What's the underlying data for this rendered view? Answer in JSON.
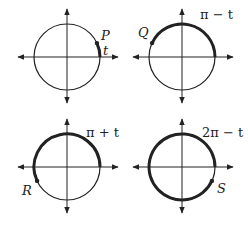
{
  "diagram": {
    "panels": [
      {
        "id": "P",
        "point_label": "P",
        "arc_label": "t",
        "center": [
          67,
          57
        ],
        "radius": 33,
        "point_angle_deg": 25,
        "arc_from_deg": 0,
        "arc_to_deg": 25
      },
      {
        "id": "Q",
        "point_label": "Q",
        "arc_label": "π − t",
        "center": [
          182,
          57
        ],
        "radius": 33,
        "point_angle_deg": 155,
        "arc_from_deg": 0,
        "arc_to_deg": 155
      },
      {
        "id": "R",
        "point_label": "R",
        "arc_label": "π + t",
        "center": [
          67,
          167
        ],
        "radius": 33,
        "point_angle_deg": 205,
        "arc_from_deg": 0,
        "arc_to_deg": 205
      },
      {
        "id": "S",
        "point_label": "S",
        "arc_label": "2π − t",
        "center": [
          182,
          167
        ],
        "radius": 33,
        "point_angle_deg": 335,
        "arc_from_deg": 0,
        "arc_to_deg": 335
      }
    ],
    "colors": {
      "stroke": "#222222",
      "background": "#ffffff"
    }
  }
}
